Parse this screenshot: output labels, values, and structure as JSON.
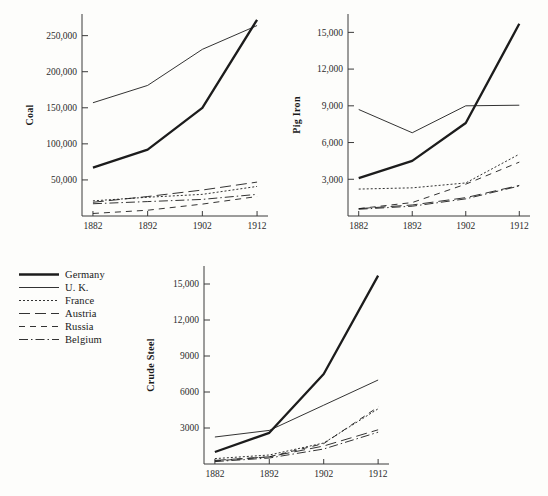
{
  "figure": {
    "background_color": "#fdfdfb",
    "ink_color": "#1c1c1c"
  },
  "legend": {
    "position": "lower-left",
    "entries": [
      {
        "label": "Germany",
        "style": "solid-thick",
        "dash": "none",
        "width": 2.3
      },
      {
        "label": "U. K.",
        "style": "solid-thin",
        "dash": "none",
        "width": 0.9
      },
      {
        "label": "France",
        "style": "dotted",
        "dash": "2,2",
        "width": 0.9
      },
      {
        "label": "Austria",
        "style": "long-dash",
        "dash": "11,5",
        "width": 0.9
      },
      {
        "label": "Russia",
        "style": "dashed",
        "dash": "6,5",
        "width": 0.9
      },
      {
        "label": "Belgium",
        "style": "dash-dot",
        "dash": "9,3,1.5,3",
        "width": 0.9
      }
    ]
  },
  "chart_data": [
    {
      "id": "coal",
      "type": "line",
      "title": "",
      "ylabel": "Coal",
      "xlabel": "",
      "x": [
        1882,
        1892,
        1902,
        1912
      ],
      "xticklabels": [
        "1882",
        "1892",
        "1902",
        "1912"
      ],
      "yticks": [
        50000,
        100000,
        150000,
        200000,
        250000
      ],
      "yticklabels": [
        "50,000",
        "100,000",
        "150,000",
        "200,000",
        "250,000"
      ],
      "ylim": [
        0,
        280000
      ],
      "xlim": [
        1880,
        1914
      ],
      "grid": false,
      "series": [
        {
          "name": "Germany",
          "values": [
            67000,
            92000,
            150000,
            272000
          ]
        },
        {
          "name": "U. K.",
          "values": [
            157000,
            181000,
            231000,
            264000
          ]
        },
        {
          "name": "France",
          "values": [
            21000,
            26000,
            30000,
            41000
          ]
        },
        {
          "name": "Austria",
          "values": [
            19000,
            27000,
            36000,
            47000
          ]
        },
        {
          "name": "Russia",
          "values": [
            3500,
            8000,
            16500,
            27000
          ]
        },
        {
          "name": "Belgium",
          "values": [
            17000,
            20000,
            23000,
            30000
          ]
        }
      ]
    },
    {
      "id": "pig_iron",
      "type": "line",
      "title": "",
      "ylabel": "Pig Iron",
      "xlabel": "",
      "x": [
        1882,
        1892,
        1902,
        1912
      ],
      "xticklabels": [
        "1882",
        "1892",
        "1902",
        "1912"
      ],
      "yticks": [
        3000,
        6000,
        9000,
        12000,
        15000
      ],
      "yticklabels": [
        "3,000",
        "6,000",
        "9,000",
        "12,000",
        "15,000"
      ],
      "ylim": [
        0,
        16500
      ],
      "xlim": [
        1880,
        1914
      ],
      "grid": false,
      "series": [
        {
          "name": "Germany",
          "values": [
            3100,
            4500,
            7600,
            15700
          ]
        },
        {
          "name": "U. K.",
          "values": [
            8700,
            6800,
            9000,
            9050
          ]
        },
        {
          "name": "France",
          "values": [
            2200,
            2300,
            2700,
            5050
          ]
        },
        {
          "name": "Austria",
          "values": [
            600,
            900,
            1500,
            2500
          ]
        },
        {
          "name": "Russia",
          "values": [
            600,
            1100,
            2600,
            4400
          ]
        },
        {
          "name": "Belgium",
          "values": [
            550,
            800,
            1400,
            2450
          ]
        }
      ]
    },
    {
      "id": "crude_steel",
      "type": "line",
      "title": "",
      "ylabel": "Crude Steel",
      "xlabel": "",
      "x": [
        1882,
        1892,
        1902,
        1912
      ],
      "xticklabels": [
        "1882",
        "1892",
        "1902",
        "1912"
      ],
      "yticks": [
        3000,
        6000,
        9000,
        12000,
        15000
      ],
      "yticklabels": [
        "3000",
        "6000",
        "9000",
        "12,000",
        "15,000"
      ],
      "ylim": [
        0,
        16500
      ],
      "xlim": [
        1880,
        1914
      ],
      "grid": false,
      "series": [
        {
          "name": "Germany",
          "values": [
            1000,
            2600,
            7500,
            15700
          ]
        },
        {
          "name": "U. K.",
          "values": [
            2250,
            2800,
            4900,
            7000
          ]
        },
        {
          "name": "France",
          "values": [
            450,
            750,
            1750,
            4600
          ]
        },
        {
          "name": "Austria",
          "values": [
            300,
            600,
            1500,
            2850
          ]
        },
        {
          "name": "Russia",
          "values": [
            250,
            600,
            1700,
            4750
          ]
        },
        {
          "name": "Belgium",
          "values": [
            200,
            500,
            1250,
            2650
          ]
        }
      ]
    }
  ]
}
